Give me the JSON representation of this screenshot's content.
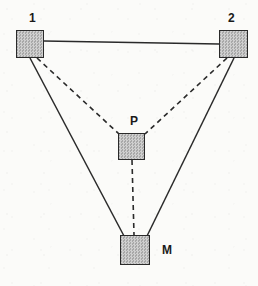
{
  "figure": {
    "type": "node-link-diagram",
    "background_color": "#fbfbf9",
    "stroke_color": "#2a2a2a",
    "node_fill_color": "#b9b9b9",
    "width": 258,
    "height": 286
  },
  "nodes": [
    {
      "id": "n1",
      "label": "1",
      "icon": "filled-square-node",
      "x": 16,
      "y": 30,
      "w": 28,
      "h": 28,
      "label_x": 29,
      "label_y": 12,
      "label_position": "above"
    },
    {
      "id": "n2",
      "label": "2",
      "icon": "filled-square-node",
      "x": 219,
      "y": 30,
      "w": 29,
      "h": 28,
      "label_x": 228,
      "label_y": 12,
      "label_position": "above"
    },
    {
      "id": "nP",
      "label": "P",
      "icon": "filled-square-node",
      "x": 118,
      "y": 133,
      "w": 27,
      "h": 27,
      "label_x": 130,
      "label_y": 115,
      "label_position": "above"
    },
    {
      "id": "nM",
      "label": "M",
      "icon": "filled-square-node",
      "x": 120,
      "y": 235,
      "w": 30,
      "h": 30,
      "label_x": 162,
      "label_y": 244,
      "label_position": "right"
    }
  ],
  "edges": [
    {
      "id": "e_1_2",
      "from": "n1",
      "to": "n2",
      "style": "solid",
      "x1": 44,
      "y1": 41,
      "x2": 219,
      "y2": 44
    },
    {
      "id": "e_1_M",
      "from": "n1",
      "to": "nM",
      "style": "solid",
      "x1": 30,
      "y1": 58,
      "x2": 124,
      "y2": 236
    },
    {
      "id": "e_2_M",
      "from": "n2",
      "to": "nM",
      "style": "solid",
      "x1": 234,
      "y1": 58,
      "x2": 147,
      "y2": 236
    },
    {
      "id": "e_1_P",
      "from": "n1",
      "to": "nP",
      "style": "dashed",
      "x1": 37,
      "y1": 58,
      "x2": 119,
      "y2": 134
    },
    {
      "id": "e_2_P",
      "from": "n2",
      "to": "nP",
      "style": "dashed",
      "x1": 227,
      "y1": 58,
      "x2": 145,
      "y2": 134
    },
    {
      "id": "e_P_M",
      "from": "nP",
      "to": "nM",
      "style": "dashed",
      "x1": 132,
      "y1": 160,
      "x2": 134,
      "y2": 235
    }
  ],
  "line_styles": {
    "solid_width": 1.5,
    "dashed_width": 1.6,
    "dash_pattern": "5 4"
  }
}
